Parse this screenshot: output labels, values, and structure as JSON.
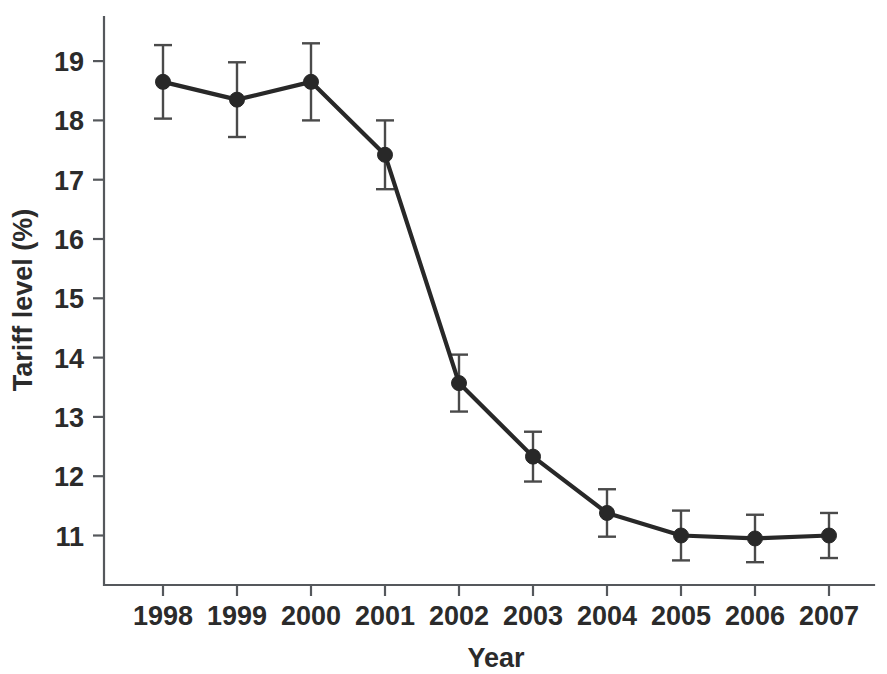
{
  "chart_data": {
    "type": "line",
    "title": "",
    "xlabel": "Year",
    "ylabel": "Tariff level (%)",
    "categories": [
      "1998",
      "1999",
      "2000",
      "2001",
      "2002",
      "2003",
      "2004",
      "2005",
      "2006",
      "2007"
    ],
    "x": [
      1998,
      1999,
      2000,
      2001,
      2002,
      2003,
      2004,
      2005,
      2006,
      2007
    ],
    "values": [
      18.65,
      18.35,
      18.65,
      17.42,
      13.57,
      12.33,
      11.38,
      11.0,
      10.95,
      11.0
    ],
    "errors": [
      0.62,
      0.63,
      0.65,
      0.58,
      0.48,
      0.42,
      0.4,
      0.42,
      0.4,
      0.38
    ],
    "error_lower": [
      18.03,
      17.72,
      18.0,
      16.84,
      13.09,
      11.91,
      10.98,
      10.58,
      10.55,
      10.62
    ],
    "error_upper": [
      19.27,
      18.98,
      19.3,
      18.0,
      14.05,
      12.75,
      11.78,
      11.42,
      11.35,
      11.38
    ],
    "series": [
      {
        "name": "Tariff level",
        "values": [
          18.65,
          18.35,
          18.65,
          17.42,
          13.57,
          12.33,
          11.38,
          11.0,
          10.95,
          11.0
        ]
      }
    ],
    "ylim": [
      10.2,
      19.5
    ],
    "xlim": [
      1997.35,
      1998.0
    ],
    "yticks": [
      11,
      12,
      13,
      14,
      15,
      16,
      17,
      18,
      19
    ],
    "ytick_labels": [
      "11",
      "12",
      "13",
      "14",
      "15",
      "16",
      "17",
      "18",
      "19"
    ],
    "xtick_labels": [
      "1998",
      "1999",
      "2000",
      "2001",
      "2002",
      "2003",
      "2004",
      "2005",
      "2006",
      "2007"
    ],
    "grid": false,
    "legend": false,
    "legend_position": "none",
    "marker": "circle",
    "line_color": "#282828",
    "marker_color": "#282828",
    "error_color": "#4a4a4a",
    "axis_color": "#55585c",
    "background_color": "#ffffff"
  }
}
